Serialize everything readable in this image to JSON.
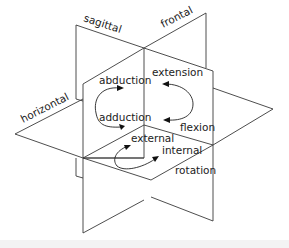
{
  "diagram": {
    "type": "anatomical planes of motion",
    "planes": [
      {
        "id": "sagittal",
        "label": "sagittal"
      },
      {
        "id": "frontal",
        "label": "frontal"
      },
      {
        "id": "horizontal",
        "label": "horizontal"
      }
    ],
    "motions": {
      "frontal_plane": {
        "top": "abduction",
        "bottom": "adduction"
      },
      "sagittal_plane": {
        "top": "extension",
        "bottom": "flexion"
      },
      "horizontal_plane": {
        "left": "external",
        "right": "internal",
        "caption": "rotation"
      }
    },
    "colors": {
      "line": "#3a3a3a",
      "text": "#222222",
      "background": "#ffffff",
      "footer_band": "#f3f3f3"
    }
  }
}
